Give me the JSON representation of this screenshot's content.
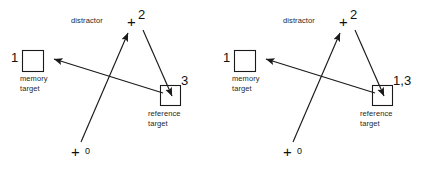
{
  "figure": {
    "type": "diagram",
    "stroke_color": "#1a1a1a",
    "background_color": "#ffffff"
  },
  "panels": [
    {
      "id": "left",
      "elements": {
        "memory_target": {
          "marker": "square",
          "number": "1",
          "caption_line1": "memory",
          "caption_line2": "target"
        },
        "distractor": {
          "marker": "plus",
          "number": "2",
          "caption": "distractor"
        },
        "reference_target": {
          "marker": "square",
          "number": "3",
          "caption_line1": "reference",
          "caption_line2": "target"
        },
        "start_fixation": {
          "marker": "plus",
          "number": "0"
        }
      },
      "arrows": [
        {
          "name": "start-to-distractor",
          "from": "start_fixation",
          "to": "distractor"
        },
        {
          "name": "distractor-to-reference",
          "from": "distractor",
          "to": "reference_target"
        },
        {
          "name": "reference-to-memory",
          "from": "reference_target",
          "to": "memory_target"
        }
      ]
    },
    {
      "id": "right",
      "elements": {
        "memory_target": {
          "marker": "square",
          "number": "1",
          "caption_line1": "memory",
          "caption_line2": "target"
        },
        "distractor": {
          "marker": "plus",
          "number": "2",
          "caption": "distractor"
        },
        "reference_target": {
          "marker": "square",
          "number": "1,3",
          "caption_line1": "reference",
          "caption_line2": "target"
        },
        "start_fixation": {
          "marker": "plus",
          "number": "0"
        }
      },
      "arrows": [
        {
          "name": "start-to-distractor",
          "from": "start_fixation",
          "to": "distractor"
        },
        {
          "name": "distractor-to-reference",
          "from": "distractor",
          "to": "reference_target"
        },
        {
          "name": "reference-to-memory",
          "from": "reference_target",
          "to": "memory_target"
        }
      ]
    }
  ]
}
